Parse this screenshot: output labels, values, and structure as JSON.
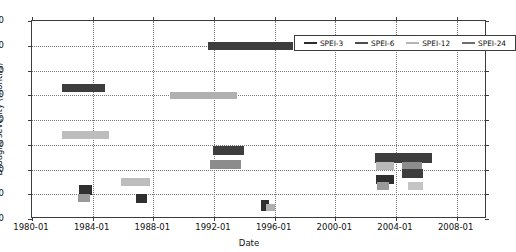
{
  "chart_data": {
    "type": "bar",
    "title": "",
    "xlabel": "Date",
    "ylabel": "Drought severity (months)",
    "ylim": [
      0,
      80
    ],
    "yticks": [
      0,
      10,
      20,
      30,
      40,
      50,
      60,
      70,
      80
    ],
    "xlim": [
      "1980-01",
      "2010-01"
    ],
    "xticks": [
      "1980-01",
      "1984-01",
      "1988-01",
      "1992-01",
      "1996-01",
      "2000-01",
      "2004-01",
      "2008-01"
    ],
    "grid": true,
    "legend_position": "upper right",
    "series": [
      {
        "name": "SPEI-3",
        "color": "#2b2b2b",
        "segments": [
          {
            "start": "1983-01",
            "end": "1983-09",
            "value": 12
          },
          {
            "start": "1986-10",
            "end": "1987-06",
            "value": 8.5
          },
          {
            "start": "1992-10",
            "end": "1994-10",
            "value": 27.5
          },
          {
            "start": "1995-05",
            "end": "1995-09",
            "value": 5.5
          },
          {
            "start": "2002-10",
            "end": "2004-02",
            "value": 16
          },
          {
            "start": "2004-05",
            "end": "2005-07",
            "value": 19.5
          }
        ]
      },
      {
        "name": "SPEI-6",
        "color": "#4d4d4d",
        "segments": [
          {
            "start": "1982-01",
            "end": "1984-10",
            "value": 53
          },
          {
            "start": "1991-06",
            "end": "1997-01",
            "value": 70
          },
          {
            "start": "2002-08",
            "end": "2006-05",
            "value": 24.5
          }
        ]
      },
      {
        "name": "SPEI-12",
        "color": "#b5b5b5",
        "segments": [
          {
            "start": "1982-01",
            "end": "1985-02",
            "value": 34
          },
          {
            "start": "1985-10",
            "end": "1987-11",
            "value": 15
          },
          {
            "start": "1991-01",
            "end": "1995-04",
            "value": 50
          },
          {
            "start": "1992-08",
            "end": "1994-08",
            "value": 22
          },
          {
            "start": "1995-09",
            "end": "1996-02",
            "value": 5
          },
          {
            "start": "2002-09",
            "end": "2003-10",
            "value": 21.5
          },
          {
            "start": "2004-07",
            "end": "2005-09",
            "value": 13.5
          }
        ]
      },
      {
        "name": "SPEI-24",
        "color": "#8f8f8f",
        "segments": [
          {
            "start": "1983-02",
            "end": "1983-09",
            "value": 8.5
          },
          {
            "start": "2002-09",
            "end": "2003-10",
            "value": 14
          }
        ]
      }
    ],
    "legend": [
      {
        "label": "SPEI-3",
        "color": "#2b2b2b"
      },
      {
        "label": "SPEI-6",
        "color": "#4d4d4d"
      },
      {
        "label": "SPEI-12",
        "color": "#b5b5b5"
      },
      {
        "label": "SPEI-24",
        "color": "#6d6d6d"
      }
    ],
    "bars": [
      {
        "series": "SPEI-6",
        "x0": 1982.0,
        "x1": 1984.8,
        "y": 53.0,
        "color": "#3d3d3d",
        "h": 3.0
      },
      {
        "series": "SPEI-24",
        "x0": 1991.6,
        "x1": 1997.2,
        "y": 70.0,
        "color": "#3d3d3d",
        "h": 3.4
      },
      {
        "series": "SPEI-12",
        "x0": 1989.1,
        "x1": 1993.5,
        "y": 50.0,
        "color": "#b0b0b0",
        "h": 3.0
      },
      {
        "series": "SPEI-12",
        "x0": 1982.0,
        "x1": 1985.1,
        "y": 34.0,
        "color": "#bdbdbd",
        "h": 3.0
      },
      {
        "series": "SPEI-3",
        "x0": 1991.95,
        "x1": 1994.0,
        "y": 27.5,
        "color": "#3d3d3d",
        "h": 3.6
      },
      {
        "series": "SPEI-12",
        "x0": 1991.75,
        "x1": 1993.75,
        "y": 22.0,
        "color": "#8c8c8c",
        "h": 3.4
      },
      {
        "series": "SPEI-12",
        "x0": 1985.85,
        "x1": 1987.8,
        "y": 15.0,
        "color": "#bdbdbd",
        "h": 3.0
      },
      {
        "series": "SPEI-3",
        "x0": 1983.1,
        "x1": 1983.95,
        "y": 11.8,
        "color": "#2f2f2f",
        "h": 4.0
      },
      {
        "series": "SPEI-24",
        "x0": 1983.05,
        "x1": 1983.85,
        "y": 8.4,
        "color": "#9a9a9a",
        "h": 3.2
      },
      {
        "series": "SPEI-3",
        "x0": 1986.85,
        "x1": 1987.6,
        "y": 8.4,
        "color": "#2f2f2f",
        "h": 3.6
      },
      {
        "series": "SPEI-3",
        "x0": 1995.1,
        "x1": 1995.6,
        "y": 5.4,
        "color": "#2f2f2f",
        "h": 4.2
      },
      {
        "series": "SPEI-12",
        "x0": 1995.45,
        "x1": 1996.0,
        "y": 4.6,
        "color": "#b0b0b0",
        "h": 3.0
      },
      {
        "series": "SPEI-6",
        "x0": 2002.6,
        "x1": 2006.4,
        "y": 24.6,
        "color": "#3d3d3d",
        "h": 4.0
      },
      {
        "series": "SPEI-24",
        "x0": 2002.7,
        "x1": 2003.9,
        "y": 21.5,
        "color": "#b8b8b8",
        "h": 3.4
      },
      {
        "series": "SPEI-12",
        "x0": 2004.4,
        "x1": 2005.7,
        "y": 21.5,
        "color": "#8c8c8c",
        "h": 3.4
      },
      {
        "series": "SPEI-12",
        "x0": 2004.4,
        "x1": 2005.8,
        "y": 18.3,
        "color": "#3d3d3d",
        "h": 3.6
      },
      {
        "series": "SPEI-3",
        "x0": 2002.7,
        "x1": 2003.9,
        "y": 16.0,
        "color": "#2f2f2f",
        "h": 3.8
      },
      {
        "series": "SPEI-3",
        "x0": 2002.75,
        "x1": 2003.55,
        "y": 13.3,
        "color": "#9a9a9a",
        "h": 3.0
      },
      {
        "series": "SPEI-12",
        "x0": 2004.8,
        "x1": 2005.8,
        "y": 13.3,
        "color": "#c4c4c4",
        "h": 3.0
      }
    ]
  }
}
